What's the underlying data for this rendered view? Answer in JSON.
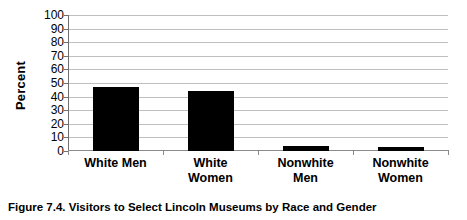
{
  "figure": {
    "caption": "Figure 7.4.  Visitors to Select Lincoln Museums by Race and Gender"
  },
  "chart_data": {
    "type": "bar",
    "title": "",
    "subtitle": "",
    "xlabel": "",
    "ylabel": "Percent",
    "categories": [
      "White Men",
      "White Women",
      "Nonwhite Men",
      "Nonwhite Women"
    ],
    "category_lines": [
      [
        "White Men"
      ],
      [
        "White",
        "Women"
      ],
      [
        "Nonwhite",
        "Men"
      ],
      [
        "Nonwhite",
        "Women"
      ]
    ],
    "values": [
      47,
      44,
      4,
      3
    ],
    "ylim": [
      0,
      100
    ],
    "ytick_values": [
      0,
      10,
      20,
      30,
      40,
      50,
      60,
      70,
      80,
      90,
      100
    ],
    "ytick_labels": [
      "0",
      "10",
      "20",
      "30",
      "40",
      "50",
      "60",
      "70",
      "80",
      "90",
      "100"
    ],
    "grid": true,
    "grid_axis": "y",
    "legend": false,
    "legend_position": "none",
    "bar_color": "#000000",
    "gridline_color": "#BFBFBF",
    "axis_color": "#6F6F6F",
    "background_color": "#FFFFFF"
  }
}
